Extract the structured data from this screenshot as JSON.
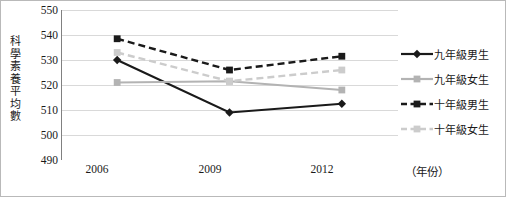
{
  "chart_data": {
    "type": "line",
    "title": "",
    "xlabel": "（年份）",
    "ylabel": "科學素養平均數",
    "categories": [
      "2006",
      "2009",
      "2012"
    ],
    "ylim": [
      490,
      550
    ],
    "yticks": [
      550,
      540,
      530,
      520,
      510,
      500,
      490
    ],
    "grid": true,
    "legend_position": "right",
    "series": [
      {
        "name": "九年級男生",
        "values": [
          530,
          509,
          512.5
        ],
        "color": "#1a1a1a",
        "dash": "solid",
        "marker": "diamond"
      },
      {
        "name": "九年級女生",
        "values": [
          521,
          521.5,
          518
        ],
        "color": "#b3b3b3",
        "dash": "solid",
        "marker": "square"
      },
      {
        "name": "十年級男生",
        "values": [
          538.5,
          526,
          531.5
        ],
        "color": "#1a1a1a",
        "dash": "dashed",
        "marker": "square"
      },
      {
        "name": "十年級女生",
        "values": [
          533,
          521.5,
          526
        ],
        "color": "#cccccc",
        "dash": "dashed",
        "marker": "square"
      }
    ]
  },
  "axis": {
    "y_title_chars": [
      "科",
      "學",
      "素",
      "養",
      "平",
      "均",
      "數"
    ],
    "y_labels": [
      "550",
      "540",
      "530",
      "520",
      "510",
      "500",
      "490"
    ],
    "x_labels": [
      "2006",
      "2009",
      "2012"
    ],
    "x_unit": "（年份）"
  },
  "legend": {
    "items": [
      {
        "label": "九年級男生"
      },
      {
        "label": "九年級女生"
      },
      {
        "label": "十年級男生"
      },
      {
        "label": "十年級女生"
      }
    ]
  },
  "colors": {
    "axis": "#808080",
    "grid": "#d9d9d9",
    "border": "#b9b9b9",
    "text": "#1a1a1a",
    "series_dark": "#1a1a1a",
    "series_mid_grey": "#b3b3b3",
    "series_light_grey": "#cccccc"
  }
}
